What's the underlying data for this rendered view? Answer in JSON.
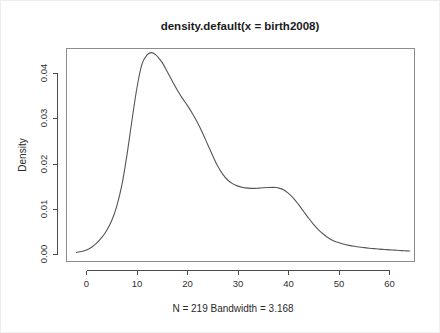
{
  "plot": {
    "title": "density.default(x = birth2008)",
    "subtitle": "N = 219   Bandwidth = 3.168",
    "ylabel": "Density",
    "xlabel": "",
    "colors": {
      "curve": "#555555",
      "axis": "#4a4a4a",
      "box": "#8d8d8d",
      "text": "#2a2a2a",
      "background": "#ffffff"
    }
  },
  "chart_data": {
    "type": "line",
    "title": "density.default(x = birth2008)",
    "subtitle": "N = 219   Bandwidth = 3.168",
    "xlabel": "",
    "ylabel": "Density",
    "grid": false,
    "legend": "none",
    "n": 219,
    "bandwidth": 3.168,
    "xlim": [
      -4.0,
      65.0
    ],
    "ylim": [
      0.0,
      0.0465
    ],
    "xticks": [
      0,
      10,
      20,
      30,
      40,
      50,
      60
    ],
    "xtick_labels": [
      "0",
      "10",
      "20",
      "30",
      "40",
      "50",
      "60"
    ],
    "yticks": [
      0.0,
      0.01,
      0.02,
      0.03,
      0.04
    ],
    "ytick_labels": [
      "0.00",
      "0.01",
      "0.02",
      "0.03",
      "0.04"
    ],
    "series": [
      {
        "name": "density",
        "x": [
          -2.0,
          -1.0,
          0.0,
          1.0,
          2.0,
          3.0,
          4.0,
          5.0,
          6.0,
          7.0,
          8.0,
          9.0,
          10.0,
          11.0,
          12.0,
          12.8,
          13.5,
          14.0,
          15.0,
          16.0,
          17.0,
          18.0,
          19.0,
          20.0,
          21.0,
          22.0,
          23.0,
          24.0,
          25.0,
          26.0,
          27.0,
          28.0,
          29.0,
          30.0,
          31.0,
          32.0,
          33.0,
          34.0,
          35.0,
          36.0,
          37.0,
          37.5,
          38.0,
          39.0,
          40.0,
          41.0,
          42.0,
          43.0,
          44.0,
          45.0,
          46.0,
          47.0,
          48.0,
          49.0,
          50.0,
          51.0,
          52.0,
          53.0,
          54.0,
          55.0,
          56.0,
          57.0,
          58.0,
          59.0,
          60.0,
          61.0,
          62.0,
          63.0,
          64.0
        ],
        "y": [
          0.00035,
          0.00055,
          0.0009,
          0.0015,
          0.0024,
          0.0036,
          0.0052,
          0.0074,
          0.0106,
          0.0152,
          0.0218,
          0.0295,
          0.0368,
          0.042,
          0.044,
          0.0445,
          0.0442,
          0.0437,
          0.0423,
          0.0403,
          0.0382,
          0.0362,
          0.0344,
          0.0328,
          0.031,
          0.029,
          0.0267,
          0.0242,
          0.0217,
          0.0194,
          0.0176,
          0.0163,
          0.0155,
          0.015,
          0.0147,
          0.01455,
          0.0145,
          0.01455,
          0.01465,
          0.0147,
          0.01472,
          0.0147,
          0.0146,
          0.0142,
          0.0134,
          0.0123,
          0.0109,
          0.0094,
          0.0079,
          0.0065,
          0.0053,
          0.0043,
          0.0035,
          0.0029,
          0.0025,
          0.00215,
          0.0019,
          0.0017,
          0.00155,
          0.0014,
          0.00128,
          0.00118,
          0.00108,
          0.001,
          0.00092,
          0.00085,
          0.00078,
          0.00072,
          0.00066
        ]
      }
    ],
    "features": {
      "primary_mode_x": 12.8,
      "primary_mode_y": 0.0445,
      "secondary_shoulder_x": 37.5,
      "secondary_shoulder_y": 0.0147
    }
  }
}
